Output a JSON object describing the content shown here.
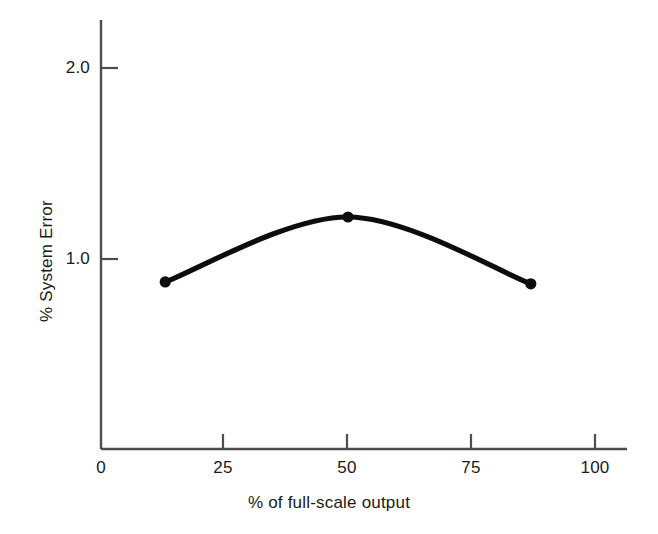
{
  "chart_data": {
    "type": "line",
    "title": "",
    "subtitle": "",
    "xlabel": "% of full-scale output",
    "ylabel": "% System Error",
    "xlim": [
      0,
      105
    ],
    "ylim": [
      0,
      2.2
    ],
    "xticks": [
      0,
      25,
      50,
      75,
      100
    ],
    "xtick_labels": [
      "0",
      "25",
      "50",
      "75",
      "100"
    ],
    "yticks": [
      1.0,
      2.0
    ],
    "ytick_labels": [
      "1.0",
      "2.0"
    ],
    "grid": false,
    "legend": null,
    "annotations": [],
    "series": [
      {
        "name": "% System Error",
        "marker": "filled-circle",
        "line_style": "solid-smooth",
        "color": "#0d0d0d",
        "x": [
          13,
          50,
          87
        ],
        "y": [
          0.88,
          1.22,
          0.87
        ]
      }
    ]
  },
  "axes": {
    "x_tick_marks_inward": true,
    "y_tick_marks_inward": true,
    "axis_color": "#4d4d4d",
    "curve_color": "#0d0d0d"
  }
}
